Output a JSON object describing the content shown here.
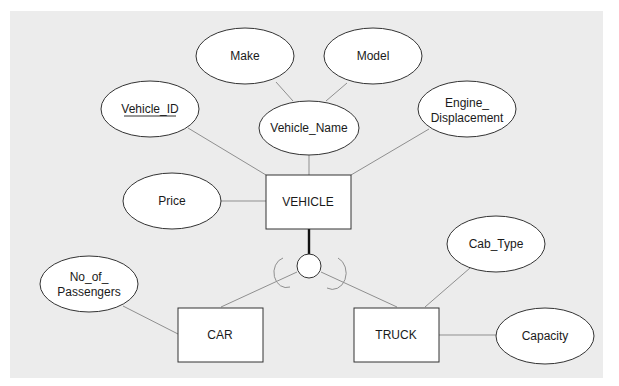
{
  "diagram": {
    "type": "er-diagram-specialization",
    "superclass": {
      "name": "VEHICLE"
    },
    "subclasses": [
      {
        "name": "CAR"
      },
      {
        "name": "TRUCK"
      }
    ],
    "specialization_symbol": "circle",
    "attributes": {
      "vehicle_id": {
        "label": "Vehicle_ID",
        "key": true
      },
      "make": {
        "label": "Make"
      },
      "model": {
        "label": "Model"
      },
      "vehicle_name": {
        "label": "Vehicle_Name"
      },
      "engine_displacement": {
        "line1": "Engine_",
        "line2": "Displacement"
      },
      "price": {
        "label": "Price"
      },
      "no_of_passengers": {
        "line1": "No_of_",
        "line2": "Passengers"
      },
      "cab_type": {
        "label": "Cab_Type"
      },
      "capacity": {
        "label": "Capacity"
      }
    },
    "relationships": [
      {
        "from": "VEHICLE",
        "to": "Vehicle_ID"
      },
      {
        "from": "VEHICLE",
        "to": "Vehicle_Name"
      },
      {
        "from": "Vehicle_Name",
        "to": "Make"
      },
      {
        "from": "Vehicle_Name",
        "to": "Model"
      },
      {
        "from": "VEHICLE",
        "to": "Engine_Displacement"
      },
      {
        "from": "VEHICLE",
        "to": "Price"
      },
      {
        "from": "VEHICLE",
        "to": "specialization-circle",
        "participation": "total"
      },
      {
        "from": "specialization-circle",
        "to": "CAR"
      },
      {
        "from": "specialization-circle",
        "to": "TRUCK"
      },
      {
        "from": "CAR",
        "to": "No_of_Passengers"
      },
      {
        "from": "TRUCK",
        "to": "Cab_Type"
      },
      {
        "from": "TRUCK",
        "to": "Capacity"
      }
    ]
  }
}
